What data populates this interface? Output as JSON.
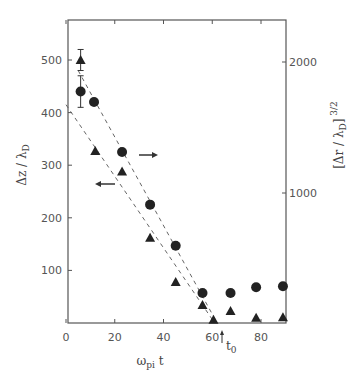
{
  "chart_data": {
    "type": "scatter",
    "title": "",
    "xlabel": "ω_pi t",
    "ylabel": "Δz / λ_D",
    "y2label": "[Δr / λ_D]^{3/2}",
    "x_ticks": [
      "0",
      "20",
      "40",
      "60",
      "80"
    ],
    "y_ticks": [
      "100",
      "200",
      "300",
      "400",
      "500"
    ],
    "y2_ticks": [
      "1000",
      "2000"
    ],
    "xlim": [
      0,
      90
    ],
    "ylim": [
      0,
      500
    ],
    "y2lim": [
      0,
      2000
    ],
    "annotations": [
      "t_0 (arrow at x≈62)",
      "arrow → (circles refer to right axis)",
      "arrow ← (triangles refer to left axis)"
    ],
    "series": [
      {
        "name": "Δz/λ_D (triangles, left axis)",
        "marker": "triangle",
        "x": [
          6,
          12,
          23,
          34.5,
          45,
          56,
          60.5,
          67.5,
          78,
          89
        ],
        "y": [
          500,
          327,
          288,
          162,
          78,
          34,
          6,
          23,
          10,
          11
        ]
      },
      {
        "name": "[Δr/λ_D]^{3/2} (circles, right axis)",
        "marker": "circle",
        "x": [
          6,
          11.5,
          23,
          34.5,
          45,
          56,
          67.5,
          78,
          89
        ],
        "y_left_scale": [
          440,
          420,
          325,
          225,
          147,
          57,
          57,
          68,
          70
        ]
      }
    ],
    "fit_lines": [
      {
        "name": "triangle fit (dashed)",
        "from": [
          0,
          415
        ],
        "to": [
          61,
          0
        ]
      },
      {
        "name": "circle fit (dashed)",
        "from": [
          5,
          480
        ],
        "to": [
          62,
          0
        ]
      }
    ],
    "grid": false
  }
}
